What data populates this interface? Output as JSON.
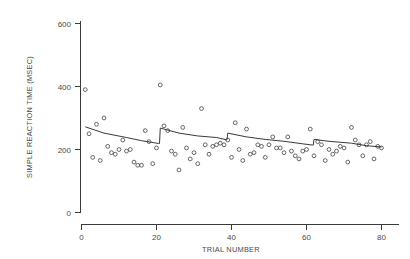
{
  "chart_data": {
    "type": "scatter",
    "title": "",
    "subtitle": "",
    "xlabel": "TRIAL NUMBER",
    "ylabel": "SIMPLE REACTION TIME (MSEC)",
    "xlim": [
      0,
      84
    ],
    "ylim": [
      0,
      640
    ],
    "xticks": [
      0,
      20,
      40,
      60,
      80
    ],
    "yticks": [
      0,
      200,
      400,
      600
    ],
    "xtick_labels": [
      "0",
      "20",
      "40",
      "60",
      "80"
    ],
    "ytick_labels": [
      "0",
      "200",
      "400",
      "600"
    ],
    "grid": false,
    "legend": false,
    "legend_position": "none",
    "marker": "open-circle",
    "marker_color": "#4b4b4b",
    "line_color": "#2e2e2e",
    "series": [
      {
        "name": "Simple reaction time per trial",
        "type": "scatter",
        "x": [
          1,
          2,
          3,
          4,
          5,
          6,
          7,
          8,
          9,
          10,
          11,
          12,
          13,
          14,
          15,
          16,
          17,
          18,
          19,
          20,
          21,
          22,
          23,
          24,
          25,
          26,
          27,
          28,
          29,
          30,
          31,
          32,
          33,
          34,
          35,
          36,
          37,
          38,
          39,
          40,
          41,
          42,
          43,
          44,
          45,
          46,
          47,
          48,
          49,
          50,
          51,
          52,
          53,
          54,
          55,
          56,
          57,
          58,
          59,
          60,
          61,
          62,
          63,
          64,
          65,
          66,
          67,
          68,
          69,
          70,
          71,
          72,
          73,
          74,
          75,
          76,
          77,
          78,
          79,
          80
        ],
        "y": [
          390,
          250,
          175,
          280,
          165,
          300,
          210,
          190,
          185,
          200,
          230,
          195,
          200,
          160,
          150,
          150,
          260,
          225,
          155,
          205,
          405,
          275,
          260,
          195,
          185,
          135,
          270,
          205,
          170,
          190,
          155,
          330,
          215,
          185,
          210,
          215,
          220,
          215,
          230,
          175,
          285,
          200,
          165,
          265,
          185,
          190,
          215,
          210,
          175,
          215,
          240,
          205,
          205,
          190,
          240,
          195,
          180,
          170,
          195,
          200,
          265,
          180,
          225,
          215,
          165,
          200,
          185,
          195,
          210,
          205,
          160,
          270,
          230,
          215,
          180,
          215,
          225,
          170,
          210,
          205
        ]
      },
      {
        "name": "Piecewise fitted trend",
        "type": "line",
        "x": [
          1,
          6,
          12,
          16,
          20.6,
          20.8,
          21,
          26,
          31,
          36,
          38.6,
          38.8,
          39,
          44,
          49,
          54,
          59,
          61.6,
          61.8,
          62,
          66,
          72,
          76,
          80
        ],
        "y": [
          272,
          252,
          238,
          228,
          219,
          219,
          268,
          252,
          243,
          238,
          231,
          231,
          252,
          240,
          232,
          226,
          218,
          214,
          214,
          232,
          226,
          220,
          212,
          208
        ]
      }
    ]
  }
}
